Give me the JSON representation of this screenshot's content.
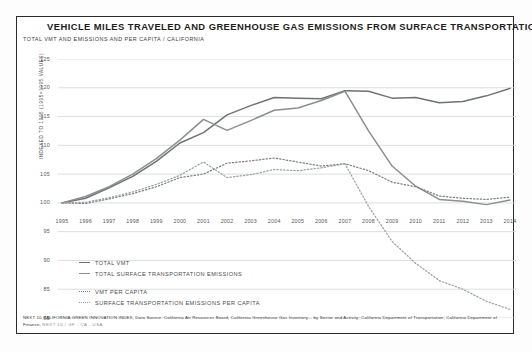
{
  "figure": {
    "title": "VEHICLE MILES TRAVELED AND GREENHOUSE GAS EMISSIONS FROM SURFACE TRANSPORTATION",
    "subtitle": "TOTAL VMT AND EMISSIONS AND PER CAPITA / CALIFORNIA",
    "source_line1": "NEXT 10 CALIFORNIA GREEN INNOVATION INDEX, Data Source: California Air Resources Board, California Greenhouse Gas Inventory – by Sector and Activity; California Department of Transportation;",
    "source_line2": "California Department of Finance,",
    "source_tag": "NEXT 10 / GF - CA - USA"
  },
  "chart_data": {
    "type": "line",
    "title": "VEHICLE MILES TRAVELED AND GREENHOUSE GAS EMISSIONS FROM SURFACE TRANSPORTATION",
    "subtitle": "TOTAL VMT AND EMISSIONS AND PER CAPITA / CALIFORNIA",
    "xlabel": "",
    "ylabel": "INDEXED TO 1995 (1995=1995 VALUES)",
    "grid": true,
    "legend_position": "bottom-left",
    "ylim": [
      80,
      125
    ],
    "yticks": [
      125,
      120,
      115,
      110,
      105,
      100,
      95,
      90,
      85,
      80
    ],
    "x": [
      "1995",
      "1996",
      "1997",
      "1998",
      "1999",
      "2000",
      "2001",
      "2002",
      "2003",
      "2004",
      "2005",
      "2006",
      "2007",
      "2008",
      "2009",
      "2010",
      "2011",
      "2012",
      "2013",
      "2014"
    ],
    "series": [
      {
        "name": "TOTAL VMT",
        "style": "solid",
        "color": "#6f7275",
        "values": [
          100.0,
          100.8,
          102.6,
          104.6,
          107.2,
          110.4,
          112.2,
          115.3,
          116.9,
          118.3,
          118.2,
          118.1,
          119.5,
          119.4,
          118.2,
          118.3,
          117.4,
          117.6,
          118.6,
          119.9
        ]
      },
      {
        "name": "TOTAL SURFACE TRANSPORTATION EMISSIONS",
        "style": "solid",
        "color": "#8b8e90",
        "values": [
          100.0,
          101.1,
          102.8,
          105.0,
          107.7,
          110.9,
          114.5,
          112.6,
          114.3,
          116.1,
          116.5,
          117.8,
          119.4,
          112.5,
          106.4,
          102.9,
          100.6,
          100.3,
          99.7,
          100.5
        ]
      },
      {
        "name": "VMT PER CAPITA",
        "style": "dotted",
        "color": "#7d8083",
        "values": [
          100.0,
          99.9,
          100.7,
          101.6,
          102.8,
          104.4,
          105.0,
          106.9,
          107.3,
          107.8,
          107.1,
          106.4,
          106.8,
          105.6,
          103.6,
          102.8,
          101.2,
          100.8,
          100.6,
          101.0
        ]
      },
      {
        "name": "SURFACE TRANSPORTATION EMISSIONS PER CAPITA",
        "style": "dotted",
        "color": "#9aa0a3",
        "values": [
          100.0,
          100.1,
          100.9,
          101.9,
          103.2,
          104.8,
          107.1,
          104.4,
          104.9,
          105.8,
          105.6,
          106.1,
          106.8,
          99.4,
          93.3,
          89.5,
          86.5,
          85.0,
          82.9,
          81.5
        ]
      }
    ]
  },
  "legend": [
    {
      "label": "TOTAL VMT",
      "swatch": "sw-solid-a"
    },
    {
      "label": "TOTAL SURFACE TRANSPORTATION EMISSIONS",
      "swatch": "sw-solid-b"
    },
    {
      "label": "VMT PER CAPITA",
      "swatch": "sw-dot-a"
    },
    {
      "label": "SURFACE TRANSPORTATION EMISSIONS PER CAPITA",
      "swatch": "sw-dot-b"
    }
  ]
}
